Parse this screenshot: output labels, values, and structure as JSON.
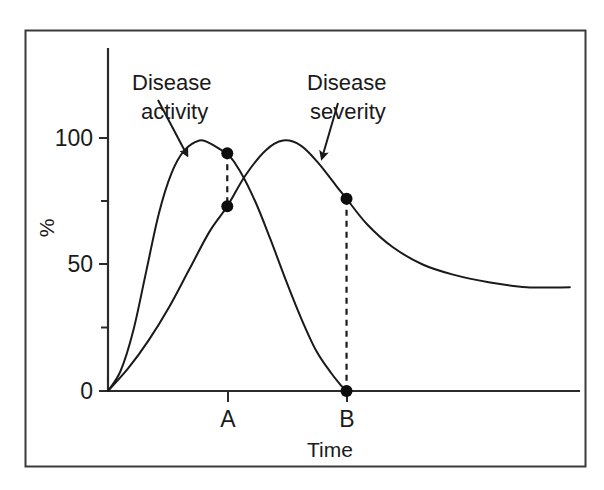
{
  "figure": {
    "border_color": "#3a3a3a",
    "background": "#ffffff",
    "ink_color": "#1a1a1a"
  },
  "chart_data": {
    "type": "line",
    "title": "",
    "subtitle": "",
    "xlabel": "Time",
    "ylabel": "%",
    "xlim": [
      0,
      186
    ],
    "ylim": [
      0,
      136
    ],
    "grid": false,
    "legend_position": "inline-annotations",
    "y_ticks_major": [
      0,
      50,
      100
    ],
    "y_tick_labels": [
      "0",
      "50",
      "100"
    ],
    "y_ticks_minor": [
      25,
      75
    ],
    "x_ticks": [
      47,
      94
    ],
    "x_tick_labels": [
      "A",
      "B"
    ],
    "series": [
      {
        "name": "Disease activity",
        "color": "#1a1a1a",
        "points": [
          {
            "x": 0,
            "y": 0
          },
          {
            "x": 5,
            "y": 8
          },
          {
            "x": 10,
            "y": 24
          },
          {
            "x": 15,
            "y": 47
          },
          {
            "x": 20,
            "y": 70
          },
          {
            "x": 25,
            "y": 86
          },
          {
            "x": 30,
            "y": 95
          },
          {
            "x": 36,
            "y": 99
          },
          {
            "x": 40,
            "y": 98
          },
          {
            "x": 45,
            "y": 95
          },
          {
            "x": 47,
            "y": 94
          },
          {
            "x": 52,
            "y": 87
          },
          {
            "x": 58,
            "y": 75
          },
          {
            "x": 64,
            "y": 60
          },
          {
            "x": 70,
            "y": 44
          },
          {
            "x": 76,
            "y": 29
          },
          {
            "x": 82,
            "y": 16
          },
          {
            "x": 88,
            "y": 7
          },
          {
            "x": 92,
            "y": 2
          },
          {
            "x": 94,
            "y": 0
          }
        ]
      },
      {
        "name": "Disease severity",
        "color": "#1a1a1a",
        "points": [
          {
            "x": 0,
            "y": 0
          },
          {
            "x": 8,
            "y": 9
          },
          {
            "x": 16,
            "y": 20
          },
          {
            "x": 24,
            "y": 33
          },
          {
            "x": 32,
            "y": 48
          },
          {
            "x": 40,
            "y": 63
          },
          {
            "x": 47,
            "y": 73
          },
          {
            "x": 54,
            "y": 85
          },
          {
            "x": 62,
            "y": 95
          },
          {
            "x": 69,
            "y": 99
          },
          {
            "x": 76,
            "y": 97
          },
          {
            "x": 83,
            "y": 90
          },
          {
            "x": 90,
            "y": 81
          },
          {
            "x": 94,
            "y": 76
          },
          {
            "x": 102,
            "y": 66
          },
          {
            "x": 112,
            "y": 57
          },
          {
            "x": 124,
            "y": 50
          },
          {
            "x": 136,
            "y": 46
          },
          {
            "x": 150,
            "y": 43
          },
          {
            "x": 165,
            "y": 41
          },
          {
            "x": 182,
            "y": 41
          }
        ]
      }
    ],
    "markers": [
      {
        "id": "a-activity",
        "x": 47,
        "y": 94,
        "series": "Disease activity",
        "label": "A"
      },
      {
        "id": "a-severity",
        "x": 47,
        "y": 73,
        "series": "Disease severity",
        "label": "A"
      },
      {
        "id": "b-severity",
        "x": 94,
        "y": 76,
        "series": "Disease severity",
        "label": "B"
      },
      {
        "id": "b-activity",
        "x": 94,
        "y": 0,
        "series": "Disease activity",
        "label": "B"
      }
    ],
    "connectors": [
      {
        "id": "connector-a",
        "x": 47,
        "y_top": 94,
        "y_bottom": 73,
        "style": "dashed"
      },
      {
        "id": "connector-b",
        "x": 94,
        "y_top": 76,
        "y_bottom": 0,
        "style": "dashed"
      }
    ],
    "annotations": [
      {
        "id": "disease-activity",
        "line1": "Disease",
        "line2": "activity",
        "text_x": 132,
        "text_y": 90,
        "arrow": {
          "x1": 158,
          "y1": 100,
          "x2": 187,
          "y2": 155
        }
      },
      {
        "id": "disease-severity",
        "line1": "Disease",
        "line2": "severity",
        "text_x": 307,
        "text_y": 90,
        "arrow": {
          "x1": 338,
          "y1": 103,
          "x2": 322,
          "y2": 158
        }
      }
    ]
  },
  "axes": {
    "y_label": "%",
    "x_label": "Time"
  }
}
